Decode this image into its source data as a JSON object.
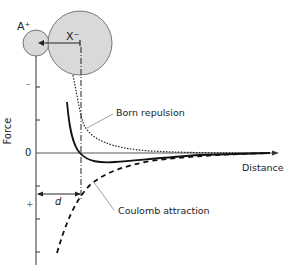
{
  "diagram": {
    "ions": {
      "cation": "A⁺",
      "anion": "X⁻"
    },
    "axes": {
      "y_label": "Force",
      "x_label": "Distance",
      "zero_label": "0",
      "negative_sign": "–",
      "positive_sign": "+"
    },
    "curves": {
      "repulsion": "Born repulsion",
      "attraction": "Coulomb attraction"
    },
    "distance_label": "d",
    "colors": {
      "ion_fill": "#d9d9d9",
      "ion_stroke": "#777777",
      "axis": "#333333",
      "curve": "#111111"
    }
  }
}
